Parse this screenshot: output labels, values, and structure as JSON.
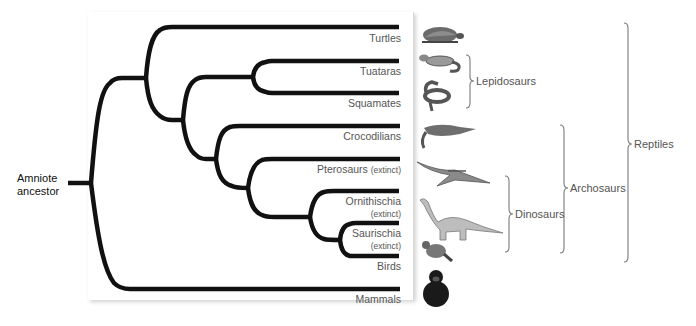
{
  "diagram": {
    "type": "phylogenetic-tree",
    "root": {
      "label_line1": "Amniote",
      "label_line2": "ancestor"
    },
    "tips": [
      {
        "id": "turtles",
        "label": "Turtles",
        "sub": ""
      },
      {
        "id": "tuataras",
        "label": "Tuataras",
        "sub": ""
      },
      {
        "id": "squamates",
        "label": "Squamates",
        "sub": ""
      },
      {
        "id": "crocodilians",
        "label": "Crocodilians",
        "sub": ""
      },
      {
        "id": "pterosaurs",
        "label": "Pterosaurs",
        "sub": "(extinct)"
      },
      {
        "id": "ornithischia",
        "label": "Ornithischia",
        "sub": "(extinct)"
      },
      {
        "id": "saurischia",
        "label": "Saurischia",
        "sub": "(extinct)"
      },
      {
        "id": "birds",
        "label": "Birds",
        "sub": ""
      },
      {
        "id": "mammals",
        "label": "Mammals",
        "sub": ""
      }
    ],
    "groups": [
      {
        "id": "lepidosaurs",
        "label": "Lepidosaurs",
        "members": [
          "Tuataras",
          "Squamates"
        ]
      },
      {
        "id": "dinosaurs",
        "label": "Dinosaurs",
        "members": [
          "Ornithischia",
          "Saurischia",
          "Birds"
        ]
      },
      {
        "id": "archosaurs",
        "label": "Archosaurs",
        "members": [
          "Crocodilians",
          "Pterosaurs",
          "Ornithischia",
          "Saurischia",
          "Birds"
        ]
      },
      {
        "id": "reptiles",
        "label": "Reptiles",
        "members": [
          "Turtles",
          "Tuataras",
          "Squamates",
          "Crocodilians",
          "Pterosaurs",
          "Ornithischia",
          "Saurischia",
          "Birds"
        ]
      }
    ],
    "illustrations": [
      "turtle",
      "tuatara",
      "snake",
      "crocodile",
      "pterosaur",
      "sauropod-dinosaur",
      "pigeon",
      "chimpanzee"
    ],
    "colors": {
      "branch": "#111111",
      "label": "#555555",
      "brace": "#777777"
    }
  }
}
